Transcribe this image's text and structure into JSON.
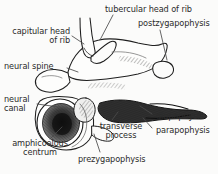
{
  "figure": {
    "background_color": "#fbfbfa",
    "ink_color": "#2b2b2b",
    "width": 218,
    "height": 174
  },
  "labels": {
    "capitular_head_of_rib": "capitular head\nof rib",
    "neural_spine": "neural spine",
    "neural_canal": "neural\ncanal",
    "amphicoelous_centrum": "amphicoelous\ncentrum",
    "prezygapophysis": "prezygapophysis",
    "transverse_process": "transverse\nprocess",
    "tubercular_head_of_rib": "tubercular head of rib",
    "postzygapophysis": "postzygapophysis",
    "diapophysis": "diapophysis",
    "parapophysis": "parapophysis"
  }
}
